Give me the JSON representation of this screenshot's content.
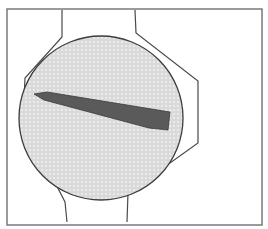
{
  "diagram": {
    "colors": {
      "background": "#ffffff",
      "frame_stroke": "#7a7a7a",
      "outline_stroke": "#4a4a4a",
      "disc_fill": "#d9d9d9",
      "disc_dot": "#f2f2f2",
      "disc_stroke": "#3c3c3c",
      "blade_fill": "#5a5a5a",
      "blade_stroke": "#3a3a3a"
    },
    "frame": {
      "x": 7,
      "y": 9,
      "width": 255,
      "height": 216
    },
    "disc": {
      "cx": 101,
      "cy": 118,
      "r": 82
    },
    "outline_left": "62,10 62,37 25,78 23,120 65,202 67,222",
    "outline_right": "135,10 136,33 198,81 198,143 128,193 127,222",
    "blade": "34,94 47,92 170,112 168,130 149,128 44,100"
  }
}
